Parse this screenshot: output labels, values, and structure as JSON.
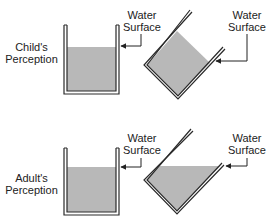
{
  "panels": [
    {
      "id": "child",
      "perception_label": [
        "Child's",
        "Perception"
      ],
      "upright_beaker_label": [
        "Water",
        "Surface"
      ],
      "tilted_beaker_label": [
        "Water",
        "Surface"
      ],
      "tilted_water_description": "water surface tilts with beaker (parallel to rim)"
    },
    {
      "id": "adult",
      "perception_label": [
        "Adult's",
        "Perception"
      ],
      "upright_beaker_label": [
        "Water",
        "Surface"
      ],
      "tilted_beaker_label": [
        "Water",
        "Surface"
      ],
      "tilted_water_description": "water surface stays horizontal"
    }
  ],
  "colors": {
    "water": "#b8b8b8",
    "outline": "#2a2a2a",
    "background": "#ffffff"
  }
}
